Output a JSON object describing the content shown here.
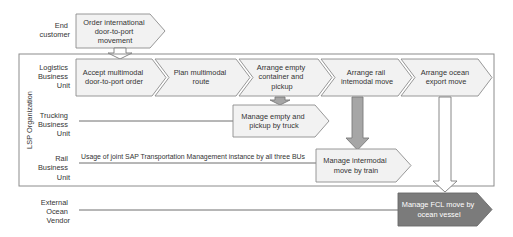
{
  "colors": {
    "border": "#8c8c8c",
    "box_fill": "#f2f2f2",
    "highlight_fill": "#7b7b7b",
    "arrow_gray": "#a6a6a6"
  },
  "organization_label": "LSP Organization",
  "lanes": {
    "end_customer": [
      "End",
      "customer"
    ],
    "logistics": [
      "Logistics",
      "Business",
      "Unit"
    ],
    "trucking": [
      "Trucking",
      "Business",
      "Unit"
    ],
    "rail": [
      "Rail",
      "Business",
      "Unit"
    ],
    "external": [
      "External",
      "Ocean",
      "Vendor"
    ]
  },
  "order_box": [
    "Order international",
    "door-to-port",
    "movement"
  ],
  "logistics_steps": [
    {
      "lines": [
        "Accept multimodal",
        "door-to-port order"
      ]
    },
    {
      "lines": [
        "Plan multimodal",
        "route"
      ]
    },
    {
      "lines": [
        "Arrange empty",
        "container and",
        "pickup"
      ]
    },
    {
      "lines": [
        "Arrange rail",
        "intemodal move"
      ]
    },
    {
      "lines": [
        "Arrange ocean",
        "export move"
      ]
    }
  ],
  "trucking_step": [
    "Manage empty and",
    "pickup by truck"
  ],
  "rail_step": [
    "Manage intermodal",
    "move by train"
  ],
  "ocean_step": [
    "Manage FCL move by",
    "ocean vessel"
  ],
  "rail_note": "Usage of joint SAP Transportation Management instance by all three BUs"
}
